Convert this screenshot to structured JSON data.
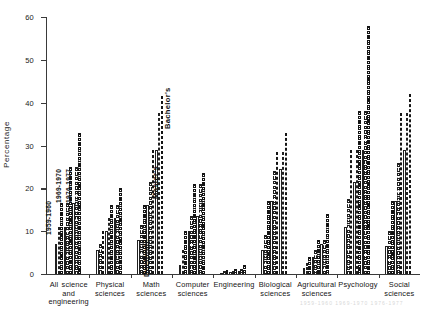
{
  "chart_data": {
    "type": "bar",
    "title": "",
    "xlabel": "",
    "ylabel": "Percentage",
    "ylim": [
      0,
      60
    ],
    "yticks": [
      0,
      10,
      20,
      30,
      40,
      50,
      60
    ],
    "grid": false,
    "legend_position": "in-plot-rotated",
    "series": [
      {
        "name": "1959-1960",
        "values": [
          7.0,
          11.0,
          16.5,
          5.5,
          10.0,
          13.0,
          8.0,
          16.0,
          29.0,
          2.0,
          10.0,
          13.5,
          0.3,
          0.5,
          0.8,
          5.5,
          17.0,
          24.5,
          1.5,
          4.0,
          7.0,
          11.0,
          21.5,
          29.0,
          6.5,
          17.0,
          29.0
        ]
      },
      {
        "name": "1969-1970",
        "values": [
          11.0,
          16.5,
          25.0,
          7.0,
          13.0,
          16.0,
          11.5,
          21.5,
          37.5,
          5.5,
          13.5,
          21.0,
          0.6,
          0.8,
          1.1,
          9.0,
          24.0,
          28.5,
          2.5,
          5.5,
          8.0,
          17.5,
          29.0,
          38.0,
          10.0,
          26.0,
          37.5
        ]
      },
      {
        "name": "1976-1977",
        "values": [
          16.5,
          25.0,
          33.0,
          10.0,
          16.0,
          20.0,
          16.0,
          29.0,
          41.5,
          10.0,
          21.0,
          23.5,
          1.0,
          1.2,
          2.0,
          17.0,
          28.5,
          33.0,
          4.0,
          8.0,
          14.0,
          29.0,
          38.0,
          58.0,
          17.0,
          37.5,
          42.0
        ]
      }
    ],
    "groups": [
      {
        "label": "All science and engineering",
        "degrees": [
          "Doctorate",
          "Master's",
          "Bachelor's"
        ]
      },
      {
        "label": "Physical sciences",
        "degrees": [
          "Doctorate",
          "Master's",
          "Bachelor's"
        ]
      },
      {
        "label": "Math sciences",
        "degrees": [
          "Doctorate",
          "Master's",
          "Bachelor's"
        ]
      },
      {
        "label": "Computer sciences",
        "degrees": [
          "Doctorate",
          "Master's",
          "Bachelor's"
        ]
      },
      {
        "label": "Engineering",
        "degrees": [
          "Doctorate",
          "Master's",
          "Bachelor's"
        ]
      },
      {
        "label": "Biological sciences",
        "degrees": [
          "Doctorate",
          "Master's",
          "Bachelor's"
        ]
      },
      {
        "label": "Agricultural sciences",
        "degrees": [
          "Doctorate",
          "Master's",
          "Bachelor's"
        ]
      },
      {
        "label": "Psychology",
        "degrees": [
          "Doctorate",
          "Master's",
          "Bachelor's"
        ]
      },
      {
        "label": "Social sciences",
        "degrees": [
          "Doctorate",
          "Master's",
          "Bachelor's"
        ]
      }
    ]
  },
  "axis": {
    "y_label": "Percentage",
    "y_ticks": [
      "0",
      "10",
      "20",
      "30",
      "40",
      "50",
      "60"
    ]
  },
  "group_labels": [
    {
      "line1": "All science",
      "line2": "and",
      "line3": "engineering"
    },
    {
      "line1": "Physical",
      "line2": "sciences",
      "line3": ""
    },
    {
      "line1": "Math",
      "line2": "sciences",
      "line3": ""
    },
    {
      "line1": "Computer",
      "line2": "sciences",
      "line3": ""
    },
    {
      "line1": "Engineering",
      "line2": "",
      "line3": ""
    },
    {
      "line1": "Biological",
      "line2": "sciences",
      "line3": ""
    },
    {
      "line1": "Agricultural",
      "line2": "sciences",
      "line3": ""
    },
    {
      "line1": "Psychology",
      "line2": "",
      "line3": ""
    },
    {
      "line1": "Social",
      "line2": "sciences",
      "line3": ""
    }
  ],
  "period_labels": {
    "first": "1959-1960",
    "second": "1969-1970",
    "third": "1976-1977"
  },
  "degree_labels": {
    "bachelors": "Bachelor's",
    "masters": "Master's",
    "doctorate": "Doctorate"
  },
  "footer_ghost": "1959-1960   1969-1970   1976-1977"
}
